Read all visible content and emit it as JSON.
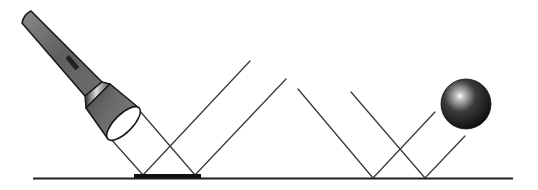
{
  "diagram": {
    "type": "reflection-illustration",
    "colors": {
      "background": "#ffffff",
      "line": "#3a3a3a",
      "ground": "#1e1e1e",
      "flashlight_body": "#6b6b6b",
      "mirror": "#111111",
      "ball": "#2a2a2a"
    },
    "elements": [
      {
        "name": "flashlight",
        "icon": "flashlight-icon"
      },
      {
        "name": "mirror",
        "x1": 134,
        "x2": 201,
        "y": 175
      },
      {
        "name": "ground-line",
        "x1": 33,
        "x2": 513,
        "y": 178
      },
      {
        "name": "ball",
        "cx": 466,
        "cy": 104,
        "r": 25
      }
    ],
    "rays": [
      {
        "group": "flashlight",
        "incident": [
          [
            110,
            138
          ],
          [
            143,
            175
          ]
        ],
        "reflected": [
          [
            143,
            175
          ],
          [
            250,
            61
          ]
        ]
      },
      {
        "group": "flashlight",
        "incident": [
          [
            139,
            110
          ],
          [
            195,
            175
          ]
        ],
        "reflected": [
          [
            195,
            175
          ],
          [
            286,
            79
          ]
        ]
      },
      {
        "group": "ball",
        "incident": [
          [
            298,
            89
          ],
          [
            373,
            178
          ]
        ],
        "reflected": [
          [
            373,
            178
          ],
          [
            435,
            112
          ]
        ]
      },
      {
        "group": "ball",
        "incident": [
          [
            351,
            92
          ],
          [
            425,
            178
          ]
        ],
        "reflected": [
          [
            425,
            178
          ],
          [
            465,
            136
          ]
        ]
      }
    ]
  }
}
